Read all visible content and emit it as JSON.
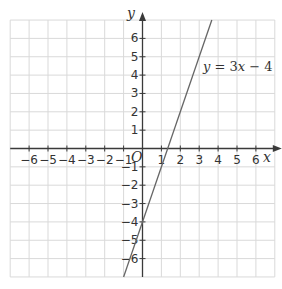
{
  "chart_data": {
    "type": "line",
    "title": "",
    "xlabel": "x",
    "ylabel": "y",
    "origin_label": "O",
    "xlim": [
      -7,
      7
    ],
    "ylim": [
      -7,
      7
    ],
    "grid": true,
    "x_ticks": [
      -6,
      -5,
      -4,
      -3,
      -2,
      -1,
      1,
      2,
      3,
      4,
      5,
      6
    ],
    "y_ticks": [
      -6,
      -5,
      -4,
      -3,
      -2,
      -1,
      1,
      2,
      3,
      4,
      5,
      6
    ],
    "series": [
      {
        "name": "y = 3x − 4",
        "equation": {
          "slope": 3,
          "intercept": -4
        },
        "x": [
          -1,
          3.667
        ],
        "y": [
          -7,
          7
        ]
      }
    ],
    "annotations": [
      {
        "text": "y = 3x − 4",
        "x": 4.6,
        "y": 4.0
      }
    ]
  },
  "labels": {
    "x_axis": "x",
    "y_axis": "y",
    "origin": "O",
    "equation": {
      "lhs": "y",
      "eq": " = 3",
      "var": "x",
      "rest": " − 4"
    }
  },
  "colors": {
    "grid": "#d9d9d9",
    "axis": "#3a3a3a",
    "line": "#666666",
    "text": "#333333"
  }
}
